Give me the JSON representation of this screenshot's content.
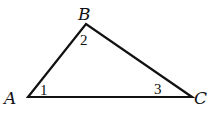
{
  "diagram": {
    "type": "triangle",
    "stroke_color": "#111111",
    "background": "#ffffff",
    "vertices": [
      {
        "id": "A",
        "label": "A",
        "x": 28,
        "y": 97
      },
      {
        "id": "B",
        "label": "B",
        "x": 86,
        "y": 24
      },
      {
        "id": "C",
        "label": "C",
        "x": 192,
        "y": 97
      }
    ],
    "angles": [
      {
        "vertex": "A",
        "label": "1"
      },
      {
        "vertex": "B",
        "label": "2"
      },
      {
        "vertex": "C",
        "label": "3"
      }
    ],
    "edges": [
      [
        "A",
        "B"
      ],
      [
        "B",
        "C"
      ],
      [
        "C",
        "A"
      ]
    ]
  }
}
